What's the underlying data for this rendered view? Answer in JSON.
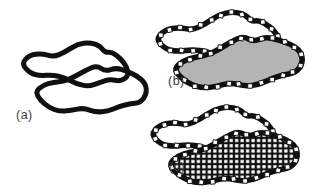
{
  "figure": {
    "background": "#ffffff",
    "colors": {
      "contour": "#101010",
      "region_fill": "#b4b4b4",
      "marker_fill": "#ffffff",
      "marker_stroke": "#101010",
      "texture_background": "#101010",
      "texture_cell_fill": "#ffffff",
      "label_color": "#3d3d3d"
    },
    "marker_shape": "small-white-square",
    "panels": [
      {
        "id": "a",
        "label": "(a)",
        "style": "plain-outline"
      },
      {
        "id": "b",
        "label": "(b)",
        "style": "outline-with-markers-gray-fill"
      },
      {
        "id": "c",
        "label": "(c)",
        "style": "outline-with-markers-square-grid-fill"
      }
    ]
  }
}
